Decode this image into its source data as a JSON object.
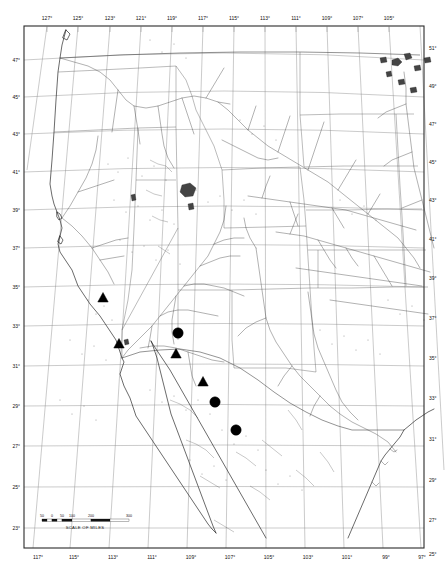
{
  "map": {
    "title": "Distribution map of western North America",
    "projection": "conic",
    "background_color": "#ffffff",
    "ink_color": "#1a1a1a",
    "graticule_color": "#8a8a8a",
    "frame_color": "#2a2a2a",
    "marker_color": "#000000"
  },
  "axes": {
    "top_longitude_labels": [
      "127°",
      "125°",
      "123°",
      "121°",
      "119°",
      "117°",
      "115°",
      "113°",
      "111°",
      "109°",
      "107°",
      "105°",
      "103°",
      "101°",
      "99°",
      "97°"
    ],
    "bottom_longitude_labels": [
      "117°",
      "115°",
      "113°",
      "111°",
      "109°",
      "107°",
      "105°",
      "103°",
      "101°",
      "99°",
      "97°"
    ],
    "left_latitude_labels": [
      "47°",
      "45°",
      "43°",
      "41°",
      "39°",
      "37°",
      "35°",
      "33°",
      "31°",
      "29°",
      "27°",
      "25°",
      "23°"
    ],
    "right_latitude_labels": [
      "51°",
      "49°",
      "47°",
      "45°",
      "43°",
      "41°",
      "39°",
      "37°",
      "35°",
      "33°",
      "31°",
      "29°",
      "27°",
      "25°"
    ]
  },
  "scale_bar": {
    "caption": "SCALE OF MILES",
    "tick_labels": [
      "50",
      "0",
      "50",
      "100",
      "200",
      "300"
    ]
  },
  "markers": {
    "legend_note": "filled triangles and filled circles denote collection localities",
    "triangles": [
      {
        "id": "t1",
        "x": 103,
        "y": 298
      },
      {
        "id": "t2",
        "x": 119,
        "y": 344
      },
      {
        "id": "t3",
        "x": 176,
        "y": 354
      },
      {
        "id": "t4",
        "x": 203,
        "y": 382
      }
    ],
    "circles": [
      {
        "id": "c1",
        "x": 178,
        "y": 333
      },
      {
        "id": "c2",
        "x": 215,
        "y": 402
      },
      {
        "id": "c3",
        "x": 236,
        "y": 430
      }
    ]
  }
}
